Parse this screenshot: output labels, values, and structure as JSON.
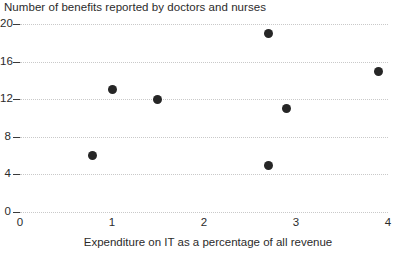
{
  "chart_data": {
    "type": "scatter",
    "title": "Number of benefits reported by doctors and nurses",
    "xlabel": "Expenditure on IT as a percentage of all revenue",
    "ylabel": "",
    "xlim": [
      0,
      4
    ],
    "ylim": [
      0,
      20
    ],
    "xticks": [
      0,
      1,
      2,
      3,
      4
    ],
    "yticks": [
      0,
      4,
      8,
      12,
      16,
      20
    ],
    "xtick_labels": [
      "0",
      "1",
      "2",
      "3",
      "4"
    ],
    "ytick_labels": [
      "0",
      "4",
      "8",
      "12",
      "16",
      "20"
    ],
    "grid": "horizontal-dotted",
    "legend": "none",
    "marker_color": "#262626",
    "grid_color": "#c9c9c9",
    "text_color": "#2b2b2b",
    "background": "#ffffff",
    "points": [
      {
        "x": 0.79,
        "y": 6
      },
      {
        "x": 1.01,
        "y": 13
      },
      {
        "x": 1.49,
        "y": 12
      },
      {
        "x": 2.7,
        "y": 19
      },
      {
        "x": 2.7,
        "y": 5
      },
      {
        "x": 2.9,
        "y": 11
      },
      {
        "x": 3.9,
        "y": 15
      }
    ]
  }
}
